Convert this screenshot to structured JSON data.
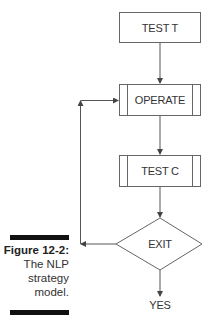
{
  "diagram": {
    "nodes": [
      {
        "id": "test_t",
        "label": "TEST T",
        "shape": "rectangle"
      },
      {
        "id": "operate",
        "label": "OPERATE",
        "shape": "predefined-process"
      },
      {
        "id": "test_c",
        "label": "TEST C",
        "shape": "predefined-process"
      },
      {
        "id": "exit",
        "label": "EXIT",
        "shape": "diamond"
      },
      {
        "id": "yes",
        "label": "YES",
        "shape": "text"
      }
    ],
    "edges": [
      {
        "from": "test_t",
        "to": "operate"
      },
      {
        "from": "operate",
        "to": "test_c"
      },
      {
        "from": "test_c",
        "to": "exit"
      },
      {
        "from": "exit",
        "to": "operate",
        "route": "left-feedback-loop"
      },
      {
        "from": "exit",
        "to": "yes"
      }
    ]
  },
  "caption": {
    "figure_number": "Figure 12-2:",
    "lines": [
      "The NLP",
      "strategy",
      "model."
    ]
  },
  "colors": {
    "stroke": "#555555",
    "text": "#333333",
    "bar": "#111111"
  }
}
